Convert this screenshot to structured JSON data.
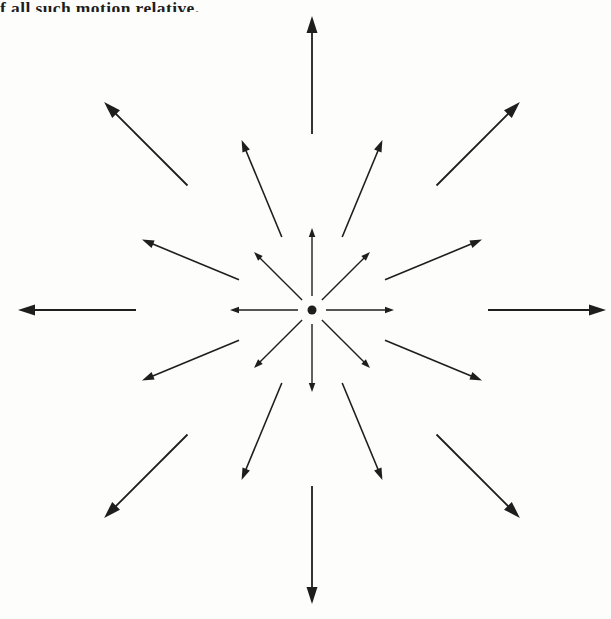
{
  "page": {
    "background": "#fdfdfc",
    "ink": "#1e1e1e"
  },
  "caption": {
    "text": "f all such motion relative."
  },
  "diagram": {
    "center": {
      "x": 312,
      "y": 310
    },
    "dot_radius": 4.5,
    "rings": [
      {
        "name": "inner",
        "r_start": 14,
        "r_end": 82,
        "angles_deg": [
          0,
          45,
          90,
          135,
          180,
          225,
          270,
          315
        ],
        "stroke_width": 1.4,
        "head_length": 9,
        "head_width": 6.5
      },
      {
        "name": "middle",
        "r_start": 79,
        "r_end": 184,
        "angles_deg": [
          22.5,
          67.5,
          112.5,
          157.5,
          202.5,
          247.5,
          292.5,
          337.5
        ],
        "stroke_width": 1.6,
        "head_length": 12,
        "head_width": 8
      },
      {
        "name": "outer",
        "r_start": 176,
        "r_end": 294,
        "angles_deg": [
          0,
          45,
          90,
          135,
          180,
          225,
          270,
          315
        ],
        "stroke_width": 1.8,
        "head_length": 17,
        "head_width": 11
      }
    ]
  }
}
